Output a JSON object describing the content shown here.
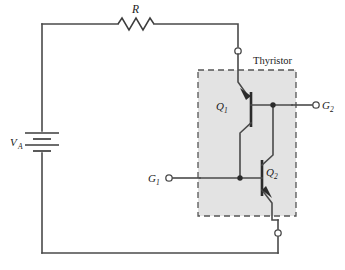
{
  "figure": {
    "type": "circuit-schematic",
    "background_color": "#ffffff",
    "wire_color": "#4a4a4a",
    "block_fill_color": "#e3e3e3",
    "block_border_color": "#555555"
  },
  "labels": {
    "resistor": "R",
    "source": "V",
    "source_sub": "A",
    "block_title": "Thyristor",
    "q1": "Q",
    "q1_sub": "1",
    "q2": "Q",
    "q2_sub": "2",
    "gate1": "G",
    "gate1_sub": "1",
    "gate2": "G",
    "gate2_sub": "2"
  },
  "components": [
    {
      "name": "resistor",
      "label": "R",
      "type": "resistor",
      "orientation": "horizontal",
      "position": "top-branch"
    },
    {
      "name": "voltage-source",
      "label": "VA",
      "type": "battery",
      "orientation": "vertical",
      "position": "left-branch",
      "cells": 2
    },
    {
      "name": "transistor-q1",
      "label": "Q1",
      "type": "pnp-bjt",
      "position": "thyristor-upper"
    },
    {
      "name": "transistor-q2",
      "label": "Q2",
      "type": "npn-bjt",
      "position": "thyristor-lower"
    }
  ],
  "terminals": [
    {
      "name": "anode-terminal",
      "label": "",
      "style": "open-circle"
    },
    {
      "name": "cathode-terminal",
      "label": "",
      "style": "open-circle"
    },
    {
      "name": "gate1-terminal",
      "label": "G1",
      "style": "open-circle"
    },
    {
      "name": "gate2-terminal",
      "label": "G2",
      "style": "open-circle"
    }
  ],
  "nodes": [
    {
      "name": "junction-gate1",
      "style": "filled-dot"
    },
    {
      "name": "junction-gate2",
      "style": "filled-dot"
    }
  ]
}
